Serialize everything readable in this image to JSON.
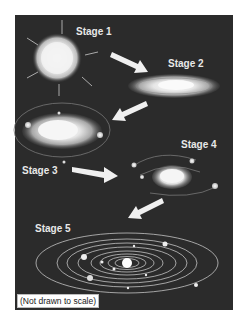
{
  "diagram": {
    "stages": [
      {
        "label": "Stage 1",
        "depiction": "collapsing gas cloud"
      },
      {
        "label": "Stage 2",
        "depiction": "flattening spinning disk"
      },
      {
        "label": "Stage 3",
        "depiction": "disk with forming protoplanets"
      },
      {
        "label": "Stage 4",
        "depiction": "protostar with planetesimals in orbit"
      },
      {
        "label": "Stage 5",
        "depiction": "solar system with planets in orbits"
      }
    ],
    "note": "(Not drawn to scale)",
    "colors": {
      "background": "#2b2b2b",
      "page": "#ffffff",
      "glow": "#f4f4f4",
      "label": "#e8e8e8"
    }
  }
}
